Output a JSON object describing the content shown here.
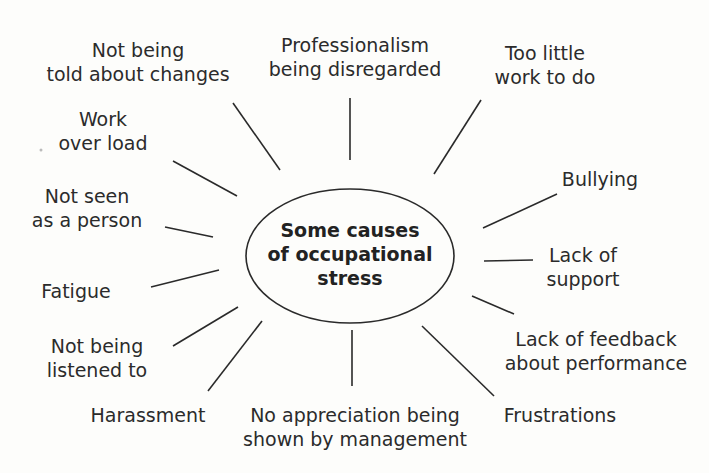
{
  "diagram": {
    "title": "Some causes of occupational stress",
    "center": {
      "lines": [
        "Some causes",
        "of occupational",
        "stress"
      ]
    },
    "nodes": [
      {
        "id": "not-told-changes",
        "lines": [
          "Not being",
          "told about changes"
        ]
      },
      {
        "id": "professionalism",
        "lines": [
          "Professionalism",
          "being disregarded"
        ]
      },
      {
        "id": "too-little-work",
        "lines": [
          "Too little",
          "work to do"
        ]
      },
      {
        "id": "work-overload",
        "lines": [
          "Work",
          "over load"
        ]
      },
      {
        "id": "bullying",
        "lines": [
          "Bullying"
        ]
      },
      {
        "id": "not-seen-person",
        "lines": [
          "Not seen",
          "as a person"
        ]
      },
      {
        "id": "lack-support",
        "lines": [
          "Lack of",
          "support"
        ]
      },
      {
        "id": "fatigue",
        "lines": [
          "Fatigue"
        ]
      },
      {
        "id": "lack-feedback",
        "lines": [
          "Lack of feedback",
          "about performance"
        ]
      },
      {
        "id": "not-listened",
        "lines": [
          "Not being",
          "listened to"
        ]
      },
      {
        "id": "harassment",
        "lines": [
          "Harassment"
        ]
      },
      {
        "id": "no-appreciation",
        "lines": [
          "No appreciation being",
          "shown by management"
        ]
      },
      {
        "id": "frustrations",
        "lines": [
          "Frustrations"
        ]
      }
    ],
    "colors": {
      "line": "#2a2a2a",
      "text": "#2b2b2b",
      "background": "#fdfdfb"
    }
  }
}
